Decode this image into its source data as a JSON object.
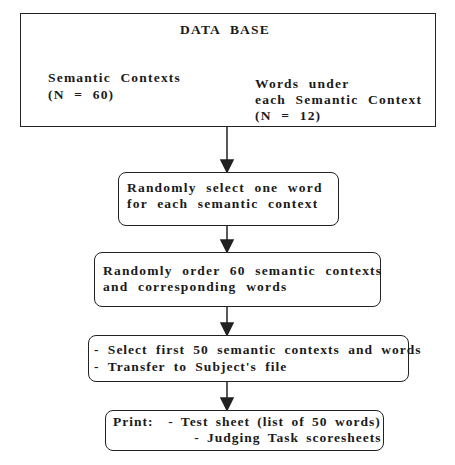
{
  "database": {
    "title": "DATA BASE",
    "left": {
      "line1": "Semantic Contexts",
      "line2": "(N = 60)"
    },
    "right": {
      "line1": "Words under",
      "line2": "each Semantic Context",
      "line3": "(N = 12)"
    }
  },
  "steps": [
    {
      "line1": "Randomly select one word",
      "line2": "for each semantic context"
    },
    {
      "line1": "Randomly order 60 semantic contexts",
      "line2": "and corresponding words"
    },
    {
      "line1": "- Select first 50 semantic contexts and words",
      "line2": "- Transfer to Subject's file"
    },
    {
      "line1": "Print:  - Test sheet (list of 50 words)",
      "line2": "           - Judging Task scoresheets"
    }
  ]
}
